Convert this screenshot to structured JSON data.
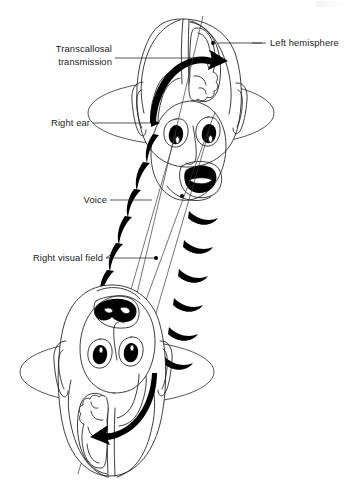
{
  "figure": {
    "background_color": "#ffffff",
    "ink_color": "#000000",
    "line_color": "#1b1b1b"
  },
  "labels": {
    "transcallosal": {
      "line1": "Transcallosal",
      "line2": "transmission",
      "align": "right"
    },
    "left_hemisphere": {
      "text": "Left hemisphere",
      "align": "left"
    },
    "right_ear": {
      "text": "Right ear",
      "align": "right"
    },
    "voice": {
      "text": "Voice",
      "align": "right"
    },
    "right_visual_field": {
      "text": "Right visual field",
      "align": "right"
    }
  },
  "elements": {
    "upper_figure": {
      "name": "upper-head-top-view",
      "description": "Head seen from above and front, speaking, with brain hemispheres visible"
    },
    "lower_figure": {
      "name": "lower-head-inverted",
      "description": "Inverted head viewed from above with brain hemispheres and transcallosal arrow"
    },
    "halo_upper": {
      "name": "upper-transverse-plane-ellipse"
    },
    "halo_lower": {
      "name": "lower-transverse-plane-ellipse"
    },
    "sound_waves_left": {
      "name": "voice-sound-waves-left",
      "count": 6
    },
    "sound_waves_right": {
      "name": "voice-sound-waves-right",
      "count": 6
    },
    "transcallosal_arrow_upper": {
      "name": "transcallosal-arrow-upper",
      "direction": "left-to-right"
    },
    "transcallosal_arrow_lower": {
      "name": "transcallosal-arrow-lower",
      "direction": "right-to-left"
    },
    "sight_lines": {
      "name": "visual-field-sight-lines",
      "count": 3
    }
  }
}
